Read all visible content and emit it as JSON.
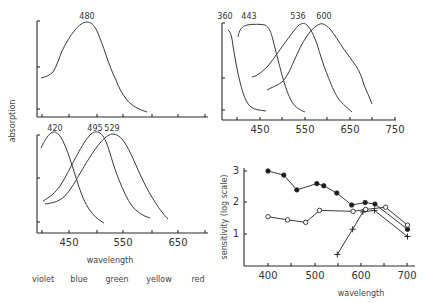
{
  "chart_data": [
    {
      "id": "panel-top-left",
      "type": "line",
      "title": "",
      "xlabel": "",
      "ylabel": "absorption",
      "xlim": [
        400,
        700
      ],
      "grid": false,
      "peak_labels": [
        "480"
      ],
      "series": [
        {
          "name": "480",
          "peak": 480,
          "x": [
            398,
            418,
            432,
            450,
            472,
            480,
            496,
            510,
            528,
            547,
            570,
            590
          ],
          "y": [
            0.42,
            0.47,
            0.67,
            0.84,
            0.98,
            1.0,
            0.94,
            0.73,
            0.48,
            0.25,
            0.11,
            0.06
          ]
        }
      ]
    },
    {
      "id": "panel-top-right",
      "type": "line",
      "title": "",
      "xlabel": "",
      "ylabel": "",
      "xlim": [
        370,
        750
      ],
      "x_ticks": [
        "450",
        "550",
        "650",
        "750"
      ],
      "grid": false,
      "peak_labels": [
        "360",
        "443",
        "536",
        "600"
      ],
      "series": [
        {
          "name": "360",
          "peak": 360,
          "x": [
            375,
            385,
            400,
            420,
            445
          ],
          "y": [
            1.0,
            0.85,
            0.45,
            0.1,
            0.02
          ]
        },
        {
          "name": "443",
          "peak": 443,
          "x": [
            390,
            400,
            420,
            450,
            470,
            490,
            510,
            530,
            550
          ],
          "y": [
            0.85,
            0.98,
            1.0,
            1.0,
            0.92,
            0.6,
            0.35,
            0.12,
            0.03
          ]
        },
        {
          "name": "536",
          "peak": 536,
          "x": [
            430,
            460,
            490,
            515,
            536,
            560,
            580,
            600,
            630,
            655
          ],
          "y": [
            0.35,
            0.46,
            0.7,
            0.88,
            1.0,
            0.92,
            0.65,
            0.4,
            0.15,
            0.03
          ]
        },
        {
          "name": "600",
          "peak": 600,
          "x": [
            465,
            490,
            520,
            550,
            575,
            598,
            625,
            650,
            675,
            700
          ],
          "y": [
            0.18,
            0.27,
            0.45,
            0.72,
            0.92,
            1.0,
            0.9,
            0.75,
            0.5,
            0.2
          ]
        }
      ]
    },
    {
      "id": "panel-bottom-left",
      "type": "line",
      "title": "",
      "xlabel": "wavelength",
      "ylabel": "absorption",
      "xlim": [
        400,
        700
      ],
      "x_ticks": [
        "450",
        "550",
        "650"
      ],
      "grid": false,
      "peak_labels": [
        "420",
        "495",
        "529"
      ],
      "color_band_labels": [
        "violet",
        "blue",
        "green",
        "yellow",
        "red"
      ],
      "series": [
        {
          "name": "420",
          "peak": 420,
          "x": [
            400,
            410,
            420,
            432,
            448,
            465,
            480,
            500,
            520
          ],
          "y": [
            0.74,
            0.93,
            1.0,
            0.93,
            0.62,
            0.3,
            0.15,
            0.06,
            0.02
          ]
        },
        {
          "name": "495",
          "peak": 495,
          "x": [
            405,
            430,
            455,
            475,
            495,
            510,
            525,
            545,
            570,
            595
          ],
          "y": [
            0.1,
            0.22,
            0.5,
            0.85,
            1.0,
            0.93,
            0.65,
            0.35,
            0.12,
            0.04
          ]
        },
        {
          "name": "529",
          "peak": 529,
          "x": [
            405,
            430,
            455,
            480,
            505,
            529,
            550,
            570,
            595,
            625
          ],
          "y": [
            0.05,
            0.1,
            0.3,
            0.6,
            0.9,
            1.0,
            0.9,
            0.62,
            0.3,
            0.05
          ]
        }
      ]
    },
    {
      "id": "panel-bottom-right",
      "type": "line",
      "title": "",
      "xlabel": "wavelength",
      "ylabel": "sensitivity (log scale)",
      "xlim": [
        350,
        715
      ],
      "ylim": [
        0,
        3.2
      ],
      "x_ticks": [
        "400",
        "500",
        "600",
        "700"
      ],
      "y_ticks": [
        "1",
        "2",
        "3"
      ],
      "grid": false,
      "series": [
        {
          "name": "filled-circles",
          "marker": "filled-circle",
          "x": [
            400,
            434,
            462,
            505,
            520,
            548,
            580,
            609,
            630,
            700
          ],
          "y": [
            3.0,
            2.87,
            2.4,
            2.6,
            2.53,
            2.3,
            1.92,
            2.0,
            1.95,
            1.15
          ]
        },
        {
          "name": "open-circles",
          "marker": "open-circle",
          "x": [
            400,
            442,
            481,
            511,
            583,
            610,
            653,
            700
          ],
          "y": [
            1.55,
            1.45,
            1.37,
            1.75,
            1.72,
            1.78,
            1.85,
            1.28
          ]
        },
        {
          "name": "crosses",
          "marker": "cross",
          "x": [
            549,
            582,
            604,
            629,
            700
          ],
          "y": [
            0.35,
            1.15,
            1.7,
            1.75,
            0.92
          ]
        }
      ]
    }
  ],
  "labels": {
    "absorption": "absorption",
    "wavelength_left": "wavelength",
    "wavelength_right": "wavelength",
    "sensitivity": "sensitivity (log scale)",
    "colors": [
      "violet",
      "blue",
      "green",
      "yellow",
      "red"
    ],
    "top_left_peak": "480",
    "top_right_peaks": [
      "360",
      "443",
      "536",
      "600"
    ],
    "bottom_left_peaks": [
      "420",
      "495",
      "529"
    ],
    "top_right_xticks": [
      "450",
      "550",
      "650",
      "750"
    ],
    "bottom_left_xticks": [
      "450",
      "550",
      "650"
    ],
    "bottom_right_xticks": [
      "400",
      "500",
      "600",
      "700"
    ],
    "bottom_right_yticks": [
      "1",
      "2",
      "3"
    ]
  }
}
